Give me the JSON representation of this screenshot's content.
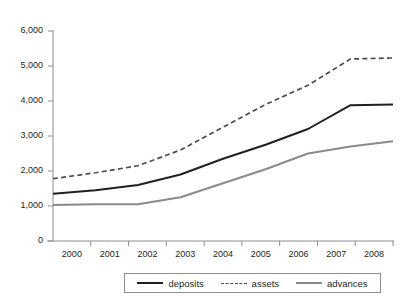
{
  "figure": {
    "top_cut_text": "",
    "bottom_cut_text": "",
    "axis_color": "#8d8d8d",
    "text_color": "#231f20"
  },
  "legend": {
    "position": "bottom-center",
    "entries": [
      {
        "label": "deposits",
        "style": "solid",
        "color": "#231f20",
        "swatch": "solid-dark"
      },
      {
        "label": "assets",
        "style": "dashed",
        "color": "#4d4d4d",
        "swatch": "dashed"
      },
      {
        "label": "advances",
        "style": "solid",
        "color": "#8a8a8a",
        "swatch": "solid-gray"
      }
    ]
  },
  "chart_data": {
    "type": "line",
    "title": "",
    "subtitle": "",
    "xlabel": "",
    "ylabel": "",
    "categories": [
      "2000",
      "2001",
      "2002",
      "2003",
      "2004",
      "2005",
      "2006",
      "2007",
      "2008"
    ],
    "x": [
      2000,
      2001,
      2002,
      2003,
      2004,
      2005,
      2006,
      2007,
      2008
    ],
    "xlim": [
      2000,
      2008
    ],
    "ylim": [
      0,
      6000
    ],
    "yticks": [
      0,
      1000,
      2000,
      3000,
      4000,
      5000,
      6000
    ],
    "ytick_labels": [
      "0",
      "1,000",
      "2,000",
      "3,000",
      "4,000",
      "5,000",
      "6,000"
    ],
    "xticks": [
      "2000",
      "2001",
      "2002",
      "2003",
      "2004",
      "2005",
      "2006",
      "2007",
      "2008"
    ],
    "grid": false,
    "legend_position": "bottom",
    "series": [
      {
        "name": "deposits",
        "style": "solid",
        "color": "#231f20",
        "values": [
          1350,
          1450,
          1600,
          1900,
          2350,
          2750,
          3200,
          3880,
          3900
        ]
      },
      {
        "name": "assets",
        "style": "dashed",
        "color": "#4d4d4d",
        "values": [
          1780,
          1950,
          2150,
          2600,
          3250,
          3900,
          4450,
          5200,
          5230
        ]
      },
      {
        "name": "advances",
        "style": "solid",
        "color": "#8a8a8a",
        "values": [
          1030,
          1050,
          1050,
          1250,
          1650,
          2050,
          2500,
          2700,
          2850
        ]
      }
    ]
  }
}
